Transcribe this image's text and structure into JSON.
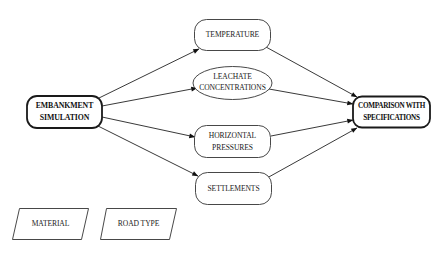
{
  "diagram": {
    "type": "flowchart",
    "nodes": {
      "embankment": {
        "line1": "EMBANKMENT",
        "line2": "SIMULATION",
        "shape": "rounded-rect-bold"
      },
      "temperature": {
        "label": "TEMPERATURE",
        "shape": "rounded-rect"
      },
      "leachate": {
        "line1": "LEACHATE",
        "line2": "CONCENTRATIONS",
        "shape": "ellipse"
      },
      "horizontal": {
        "line1": "HORIZONTAL",
        "line2": "PRESSURES",
        "shape": "rounded-rect"
      },
      "settlements": {
        "label": "SETTLEMENTS",
        "shape": "rounded-rect"
      },
      "comparison": {
        "line1": "COMPARISON WITH",
        "line2": "SPECIFICATIONS",
        "shape": "rounded-rect-bold"
      },
      "material": {
        "label": "MATERIAL",
        "shape": "parallelogram"
      },
      "road_type": {
        "label": "ROAD TYPE",
        "shape": "parallelogram"
      }
    },
    "edges": [
      {
        "from": "EMBANKMENT SIMULATION",
        "to": "TEMPERATURE"
      },
      {
        "from": "EMBANKMENT SIMULATION",
        "to": "LEACHATE CONCENTRATIONS"
      },
      {
        "from": "EMBANKMENT SIMULATION",
        "to": "HORIZONTAL PRESSURES"
      },
      {
        "from": "EMBANKMENT SIMULATION",
        "to": "SETTLEMENTS"
      },
      {
        "from": "TEMPERATURE",
        "to": "COMPARISON WITH SPECIFICATIONS"
      },
      {
        "from": "LEACHATE CONCENTRATIONS",
        "to": "COMPARISON WITH SPECIFICATIONS"
      },
      {
        "from": "HORIZONTAL PRESSURES",
        "to": "COMPARISON WITH SPECIFICATIONS"
      },
      {
        "from": "SETTLEMENTS",
        "to": "COMPARISON WITH SPECIFICATIONS"
      }
    ]
  }
}
